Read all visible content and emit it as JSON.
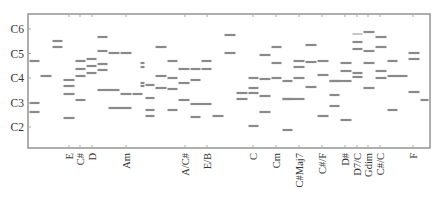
{
  "chart_data": {
    "type": "scatter",
    "subtype": "piano-roll / note-segment plot",
    "title": "",
    "xlabel": "",
    "ylabel": "",
    "grid": false,
    "legend": null,
    "y_ticks": [
      {
        "label": "C6",
        "pitch": 6
      },
      {
        "label": "C5",
        "pitch": 5
      },
      {
        "label": "C4",
        "pitch": 4
      },
      {
        "label": "C3",
        "pitch": 3
      },
      {
        "label": "C2",
        "pitch": 2
      }
    ],
    "ylim": [
      1.1,
      6.6
    ],
    "x_ticks": [
      {
        "label": "E",
        "x": 69
      },
      {
        "label": "C#",
        "x": 80
      },
      {
        "label": "D",
        "x": 92
      },
      {
        "label": "Am",
        "x": 126
      },
      {
        "label": "A/C#",
        "x": 185
      },
      {
        "label": "E/B",
        "x": 207
      },
      {
        "label": "C",
        "x": 253
      },
      {
        "label": "Cm",
        "x": 276
      },
      {
        "label": "C#Maj7",
        "x": 299
      },
      {
        "label": "C#/F",
        "x": 322
      },
      {
        "label": "D#",
        "x": 345
      },
      {
        "label": "D7/C",
        "x": 357
      },
      {
        "label": "Gdim",
        "x": 368
      },
      {
        "label": "C#/C",
        "x": 380
      },
      {
        "label": "F",
        "x": 413
      }
    ],
    "segments_pixel_note": "segments as [x_start, x_end, y] in screenshot pixels; pitch = 4 + (78 - y)/24.5 octaves",
    "segments": [
      [
        29,
        40,
        61
      ],
      [
        29,
        40,
        103
      ],
      [
        29,
        40,
        112
      ],
      [
        40,
        52,
        76
      ],
      [
        52,
        63,
        41
      ],
      [
        52,
        63,
        47
      ],
      [
        63,
        75,
        80
      ],
      [
        63,
        75,
        86
      ],
      [
        63,
        75,
        94
      ],
      [
        63,
        75,
        118
      ],
      [
        75,
        86,
        61
      ],
      [
        75,
        86,
        69
      ],
      [
        75,
        86,
        76
      ],
      [
        75,
        86,
        100
      ],
      [
        86,
        97,
        59
      ],
      [
        86,
        97,
        66
      ],
      [
        86,
        97,
        73
      ],
      [
        97,
        108,
        37
      ],
      [
        97,
        108,
        51
      ],
      [
        97,
        108,
        64
      ],
      [
        97,
        108,
        70
      ],
      [
        97,
        120,
        90
      ],
      [
        108,
        120,
        53
      ],
      [
        108,
        132,
        108
      ],
      [
        120,
        132,
        53
      ],
      [
        120,
        132,
        94
      ],
      [
        132,
        143,
        94
      ],
      [
        140,
        145,
        63
      ],
      [
        140,
        145,
        67
      ],
      [
        140,
        145,
        83
      ],
      [
        140,
        145,
        86
      ],
      [
        145,
        155,
        85
      ],
      [
        145,
        155,
        98
      ],
      [
        145,
        155,
        110
      ],
      [
        145,
        155,
        116
      ],
      [
        155,
        167,
        47
      ],
      [
        155,
        167,
        76
      ],
      [
        155,
        167,
        88
      ],
      [
        167,
        178,
        61
      ],
      [
        167,
        178,
        78
      ],
      [
        167,
        178,
        89
      ],
      [
        167,
        178,
        110
      ],
      [
        178,
        190,
        69
      ],
      [
        178,
        190,
        83
      ],
      [
        178,
        190,
        100
      ],
      [
        190,
        201,
        69
      ],
      [
        190,
        201,
        80
      ],
      [
        190,
        212,
        104
      ],
      [
        190,
        201,
        117
      ],
      [
        201,
        212,
        61
      ],
      [
        201,
        212,
        69
      ],
      [
        212,
        224,
        116
      ],
      [
        224,
        236,
        35
      ],
      [
        224,
        236,
        53
      ],
      [
        236,
        248,
        93
      ],
      [
        236,
        248,
        99
      ],
      [
        248,
        259,
        78
      ],
      [
        248,
        259,
        88
      ],
      [
        248,
        259,
        93
      ],
      [
        248,
        259,
        126
      ],
      [
        259,
        271,
        55
      ],
      [
        259,
        271,
        79
      ],
      [
        259,
        271,
        96
      ],
      [
        259,
        271,
        112
      ],
      [
        271,
        282,
        47
      ],
      [
        271,
        282,
        63
      ],
      [
        271,
        282,
        78
      ],
      [
        282,
        293,
        81
      ],
      [
        282,
        293,
        99
      ],
      [
        282,
        293,
        130
      ],
      [
        293,
        305,
        61
      ],
      [
        293,
        305,
        67
      ],
      [
        293,
        305,
        78
      ],
      [
        282,
        305,
        99
      ],
      [
        305,
        317,
        45
      ],
      [
        305,
        317,
        62
      ],
      [
        305,
        317,
        87
      ],
      [
        317,
        329,
        61
      ],
      [
        317,
        329,
        75
      ],
      [
        317,
        329,
        116
      ],
      [
        329,
        340,
        81
      ],
      [
        329,
        340,
        95
      ],
      [
        329,
        340,
        106
      ],
      [
        340,
        352,
        63
      ],
      [
        340,
        352,
        71
      ],
      [
        329,
        352,
        81
      ],
      [
        340,
        352,
        120
      ],
      [
        352,
        363,
        42
      ],
      [
        352,
        363,
        49
      ],
      [
        352,
        363,
        73
      ],
      [
        352,
        363,
        77
      ],
      [
        363,
        375,
        32
      ],
      [
        363,
        375,
        51
      ],
      [
        363,
        375,
        63
      ],
      [
        363,
        375,
        88
      ],
      [
        375,
        387,
        37
      ],
      [
        375,
        387,
        47
      ],
      [
        375,
        387,
        71
      ],
      [
        375,
        387,
        78
      ],
      [
        387,
        398,
        61
      ],
      [
        387,
        408,
        76
      ],
      [
        387,
        398,
        110
      ],
      [
        408,
        420,
        53
      ],
      [
        408,
        420,
        59
      ],
      [
        408,
        420,
        92
      ],
      [
        420,
        429,
        100
      ]
    ],
    "segments_light": [
      [
        352,
        363,
        34
      ]
    ],
    "plot_area": {
      "x0": 28,
      "y0": 14,
      "x1": 430,
      "y1": 148
    },
    "colors": {
      "segment": "#8a8a8a",
      "frame": "#9a9a9a",
      "text": "#333333"
    }
  }
}
